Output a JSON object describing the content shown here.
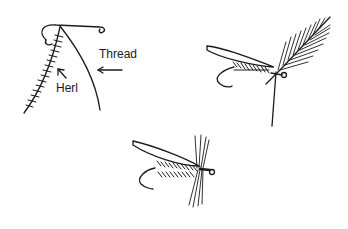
{
  "figure": {
    "panels": [
      {
        "id": "step-1",
        "labels": {
          "thread": "Thread",
          "herl": "Herl"
        }
      },
      {
        "id": "step-2"
      },
      {
        "id": "step-3"
      }
    ]
  },
  "colors": {
    "ink": "#1a1a1a",
    "background": "#ffffff"
  }
}
